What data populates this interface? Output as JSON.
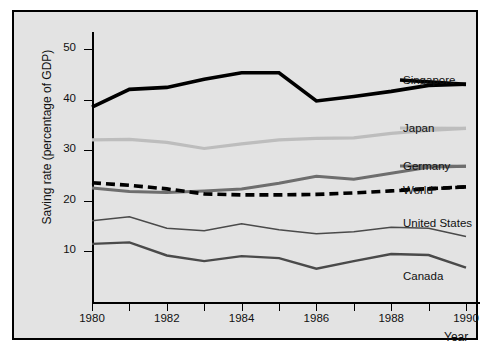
{
  "chart_data": {
    "type": "line",
    "title": "",
    "xlabel": "Year",
    "ylabel": "Saving rate (percentage of GDP)",
    "x": [
      1980,
      1981,
      1982,
      1983,
      1984,
      1985,
      1986,
      1987,
      1988,
      1989,
      1990
    ],
    "xlim": [
      1980,
      1990
    ],
    "ylim": [
      0,
      52
    ],
    "xticks": [
      1980,
      1981,
      1982,
      1983,
      1984,
      1985,
      1986,
      1987,
      1988,
      1989,
      1990
    ],
    "xtick_labels": [
      "1980",
      "",
      "1982",
      "",
      "1984",
      "",
      "1986",
      "",
      "1988",
      "",
      "1990"
    ],
    "yticks": [
      10,
      20,
      30,
      40,
      50
    ],
    "ytick_labels": [
      "10",
      "20",
      "30",
      "40",
      "50"
    ],
    "grid": false,
    "legend_position": "right-inline",
    "series": [
      {
        "name": "Singapore",
        "color": "#000000",
        "style": "solid",
        "width": 3.6,
        "values": [
          38.5,
          42.0,
          42.4,
          44.0,
          45.3,
          45.3,
          39.7,
          40.6,
          41.6,
          42.8,
          43.0
        ]
      },
      {
        "name": "Japan",
        "color": "#bdbdbd",
        "style": "solid",
        "width": 3.2,
        "values": [
          32.0,
          32.1,
          31.5,
          30.3,
          31.2,
          32.0,
          32.3,
          32.4,
          33.3,
          33.9,
          34.3
        ]
      },
      {
        "name": "Germany",
        "color": "#6e6e6e",
        "style": "solid",
        "width": 3.0,
        "values": [
          22.5,
          21.8,
          21.6,
          21.9,
          22.3,
          23.4,
          24.8,
          24.2,
          25.4,
          26.6,
          26.8
        ]
      },
      {
        "name": "World",
        "color": "#000000",
        "style": "dashed",
        "width": 3.6,
        "values": [
          23.5,
          23.0,
          22.3,
          21.3,
          21.1,
          21.1,
          21.2,
          21.5,
          21.9,
          22.3,
          22.7
        ]
      },
      {
        "name": "United States",
        "color": "#4a4a4a",
        "style": "solid",
        "width": 1.5,
        "values": [
          16.0,
          16.8,
          14.5,
          14.0,
          15.4,
          14.2,
          13.4,
          13.8,
          14.7,
          14.5,
          12.9
        ]
      },
      {
        "name": "Canada",
        "color": "#4a4a4a",
        "style": "solid",
        "width": 2.4,
        "values": [
          11.4,
          11.7,
          9.1,
          8.0,
          9.0,
          8.6,
          6.5,
          8.0,
          9.4,
          9.2,
          6.7
        ]
      }
    ]
  },
  "labels": {
    "singapore": "Singapore",
    "japan": "Japan",
    "germany": "Germany",
    "world": "World",
    "united_states": "United States",
    "canada": "Canada"
  },
  "axis": {
    "y_title": "Saving rate (percentage of GDP)",
    "x_title": "Year"
  }
}
